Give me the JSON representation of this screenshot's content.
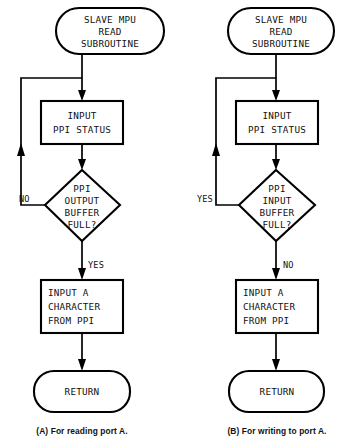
{
  "figure": {
    "background_color": "#ffffff",
    "ink_color": "#000000"
  },
  "charts": [
    {
      "id": "chart-a",
      "caption": "(A) For reading port A.",
      "nodes": {
        "start": "SLAVE MPU\nREAD\nSUBROUTINE",
        "start_line1": "SLAVE MPU",
        "start_line2": "READ",
        "start_line3": "SUBROUTINE",
        "status": "INPUT\nPPI STATUS",
        "status_line1": "INPUT",
        "status_line2": "PPI STATUS",
        "decision_line1": "PPI",
        "decision_line2": "OUTPUT",
        "decision_line3": "BUFFER",
        "decision_line4": "FULL?",
        "action_line1": "INPUT A",
        "action_line2": "CHARACTER",
        "action_line3": "FROM PPI",
        "end": "RETURN"
      },
      "branches": {
        "loop_back_label": "NO",
        "continue_label": "YES"
      }
    },
    {
      "id": "chart-b",
      "caption": "(B) For writing to port A.",
      "nodes": {
        "start": "SLAVE MPU\nREAD\nSUBROUTINE",
        "start_line1": "SLAVE MPU",
        "start_line2": "READ",
        "start_line3": "SUBROUTINE",
        "status": "INPUT\nPPI STATUS",
        "status_line1": "INPUT",
        "status_line2": "PPI STATUS",
        "decision_line1": "PPI",
        "decision_line2": "INPUT",
        "decision_line3": "BUFFER",
        "decision_line4": "FULL?",
        "action_line1": "INPUT A",
        "action_line2": "CHARACTER",
        "action_line3": "FROM PPI",
        "end": "RETURN"
      },
      "branches": {
        "loop_back_label": "YES",
        "continue_label": "NO"
      }
    }
  ]
}
